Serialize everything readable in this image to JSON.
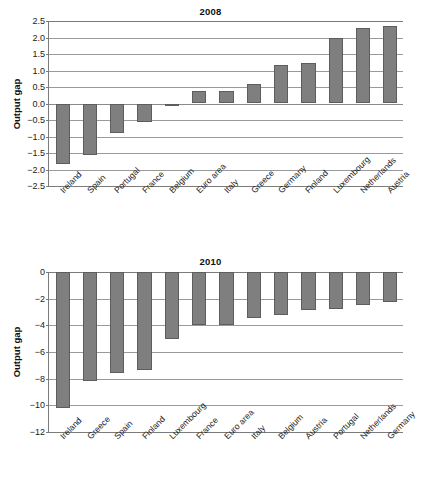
{
  "chart_data": [
    {
      "id": "output-gap-2008",
      "type": "bar",
      "title": "2008",
      "xlabel": "",
      "ylabel": "Output gap",
      "ylim": [
        -2.5,
        2.5
      ],
      "yticks": [
        2.5,
        2.0,
        1.5,
        1.0,
        0.5,
        0.0,
        -0.5,
        -1.0,
        -1.5,
        -2.0,
        -2.5
      ],
      "ytick_labels": [
        "2.5",
        "2.0",
        "1.5",
        "1.0",
        "0.5",
        "0.0",
        "−0.5",
        "−1.0",
        "−1.5",
        "−2.0",
        "−2.5"
      ],
      "grid": true,
      "legend": "none",
      "bar_color": "#7f7f7f",
      "bar_edge_color": "#5d5d5d",
      "categories": [
        "Ireland",
        "Spain",
        "Portugal",
        "France",
        "Belgium",
        "Euro area",
        "Italy",
        "Greece",
        "Germany",
        "Finland",
        "Luxembourg",
        "Netherlands",
        "Austria"
      ],
      "values": [
        -1.82,
        -1.56,
        -0.88,
        -0.55,
        -0.03,
        0.37,
        0.38,
        0.58,
        1.18,
        1.22,
        1.98,
        2.3,
        2.34
      ]
    },
    {
      "id": "output-gap-2010",
      "type": "bar",
      "title": "2010",
      "xlabel": "",
      "ylabel": "Output gap",
      "ylim": [
        -12,
        0
      ],
      "yticks": [
        0,
        -2,
        -4,
        -6,
        -8,
        -10,
        -12
      ],
      "ytick_labels": [
        "0",
        "−2",
        "−4",
        "−6",
        "−8",
        "−10",
        "−12"
      ],
      "grid": true,
      "legend": "none",
      "bar_color": "#7f7f7f",
      "bar_edge_color": "#5d5d5d",
      "categories": [
        "Ireland",
        "Greece",
        "Spain",
        "Finland",
        "Luxembourg",
        "France",
        "Euro area",
        "Italy",
        "Belgium",
        "Austria",
        "Portugal",
        "Netherlands",
        "Germany"
      ],
      "values": [
        -10.2,
        -8.2,
        -7.6,
        -7.35,
        -5.05,
        -4.0,
        -3.95,
        -3.45,
        -3.2,
        -2.85,
        -2.8,
        -2.45,
        -2.25
      ]
    }
  ]
}
